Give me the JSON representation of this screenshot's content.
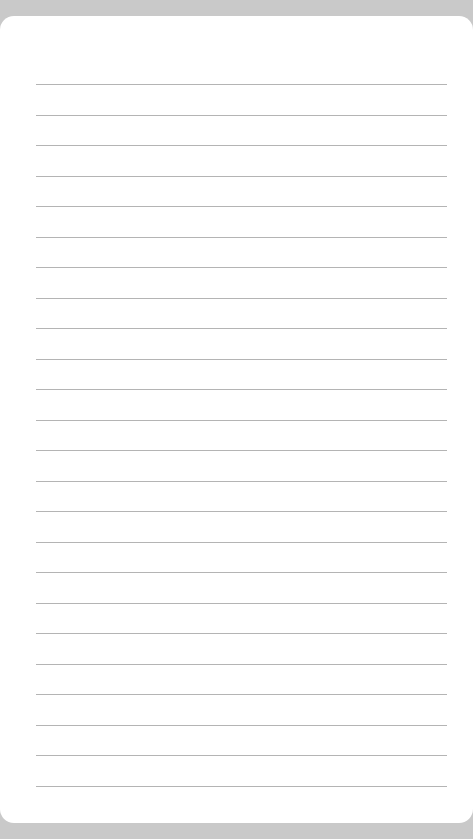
{
  "page": {
    "type": "lined-notepad",
    "frame_color": "#c9c9c9",
    "sheet_color": "#ffffff",
    "rule_color": "#b4b4b4",
    "rule_count": 24,
    "first_rule_y": 84,
    "rule_spacing": 30.5,
    "content": ""
  }
}
